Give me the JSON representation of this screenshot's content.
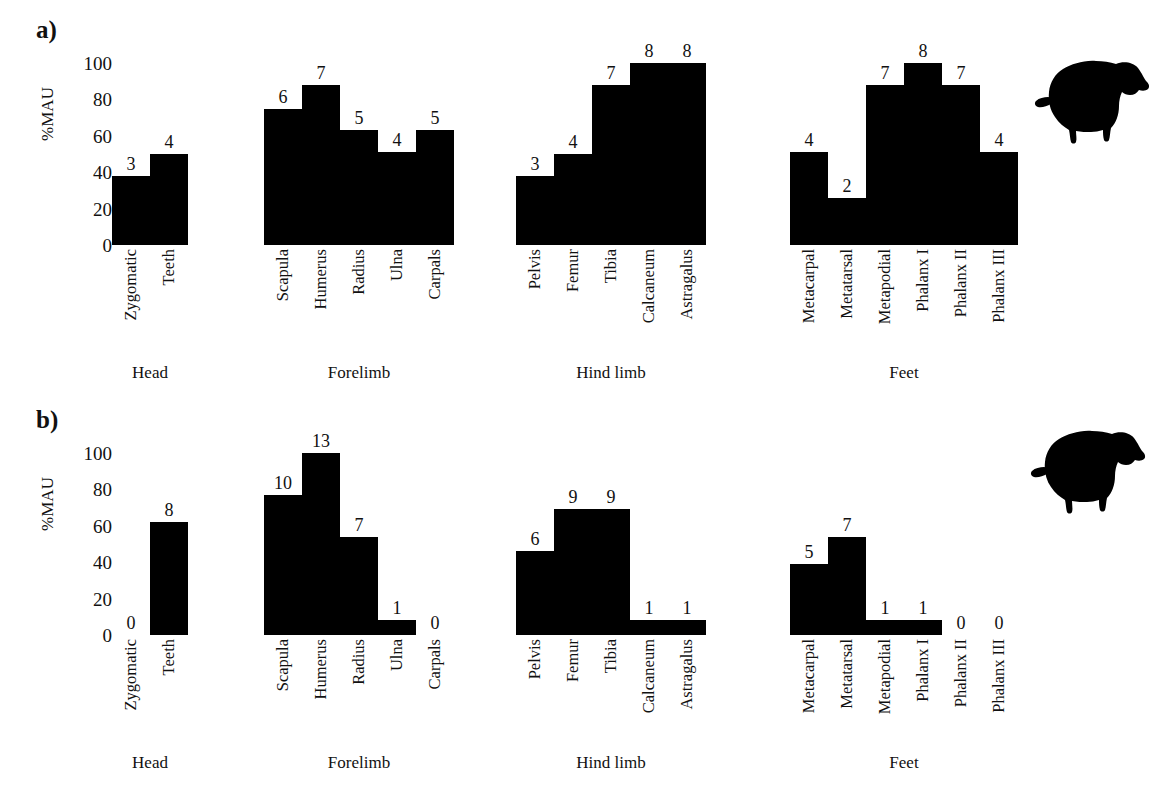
{
  "figure": {
    "panels": [
      {
        "id": "a",
        "label": "a)",
        "ylabel": "%MAU",
        "yticks": [
          "0",
          "20",
          "40",
          "60",
          "80",
          "100"
        ],
        "icon": "sheep-silhouette",
        "groups": [
          {
            "name": "Head",
            "categories": [
              "Zygomatic",
              "Teeth"
            ],
            "counts": [
              3,
              4
            ],
            "percent": [
              38,
              50
            ]
          },
          {
            "name": "Forelimb",
            "categories": [
              "Scapula",
              "Humerus",
              "Radius",
              "Ulna",
              "Carpals"
            ],
            "counts": [
              6,
              7,
              5,
              4,
              5
            ],
            "percent": [
              75,
              88,
              63,
              51,
              63
            ]
          },
          {
            "name": "Hind limb",
            "categories": [
              "Pelvis",
              "Femur",
              "Tibia",
              "Calcaneum",
              "Astragalus"
            ],
            "counts": [
              3,
              4,
              7,
              8,
              8
            ],
            "percent": [
              38,
              50,
              88,
              100,
              100
            ]
          },
          {
            "name": "Feet",
            "categories": [
              "Metacarpal",
              "Metatarsal",
              "Metapodial",
              "Phalanx I",
              "Phalanx II",
              "Phalanx III"
            ],
            "counts": [
              4,
              2,
              7,
              8,
              7,
              4
            ],
            "percent": [
              51,
              26,
              88,
              100,
              88,
              51
            ]
          }
        ]
      },
      {
        "id": "b",
        "label": "b)",
        "ylabel": "%MAU",
        "yticks": [
          "0",
          "20",
          "40",
          "60",
          "80",
          "100"
        ],
        "icon": "sheep-silhouette",
        "groups": [
          {
            "name": "Head",
            "categories": [
              "Zygomatic",
              "Teeth"
            ],
            "counts": [
              0,
              8
            ],
            "percent": [
              0,
              62
            ]
          },
          {
            "name": "Forelimb",
            "categories": [
              "Scapula",
              "Humerus",
              "Radius",
              "Ulna",
              "Carpals"
            ],
            "counts": [
              10,
              13,
              7,
              1,
              0
            ],
            "percent": [
              77,
              100,
              54,
              8,
              0
            ]
          },
          {
            "name": "Hind limb",
            "categories": [
              "Pelvis",
              "Femur",
              "Tibia",
              "Calcaneum",
              "Astragalus"
            ],
            "counts": [
              6,
              9,
              9,
              1,
              1
            ],
            "percent": [
              46,
              69,
              69,
              8,
              8
            ]
          },
          {
            "name": "Feet",
            "categories": [
              "Metacarpal",
              "Metatarsal",
              "Metapodial",
              "Phalanx I",
              "Phalanx II",
              "Phalanx III"
            ],
            "counts": [
              5,
              7,
              1,
              1,
              0,
              0
            ],
            "percent": [
              39,
              54,
              8,
              8,
              0,
              0
            ]
          }
        ]
      }
    ]
  },
  "chart_data": [
    {
      "type": "bar",
      "title": "a)",
      "xlabel": "",
      "ylabel": "%MAU",
      "ylim": [
        0,
        100
      ],
      "grid": false,
      "legend": "none",
      "group_labels": [
        "Head",
        "Forelimb",
        "Hind limb",
        "Feet"
      ],
      "categories": [
        "Zygomatic",
        "Teeth",
        "Scapula",
        "Humerus",
        "Radius",
        "Ulna",
        "Carpals",
        "Pelvis",
        "Femur",
        "Tibia",
        "Calcaneum",
        "Astragalus",
        "Metacarpal",
        "Metatarsal",
        "Metapodial",
        "Phalanx I",
        "Phalanx II",
        "Phalanx III"
      ],
      "values": [
        38,
        50,
        75,
        88,
        63,
        51,
        63,
        38,
        50,
        88,
        100,
        100,
        51,
        26,
        88,
        100,
        88,
        51
      ],
      "data_labels": [
        3,
        4,
        6,
        7,
        5,
        4,
        5,
        3,
        4,
        7,
        8,
        8,
        4,
        2,
        7,
        8,
        7,
        4
      ],
      "yticks": [
        0,
        20,
        40,
        60,
        80,
        100
      ]
    },
    {
      "type": "bar",
      "title": "b)",
      "xlabel": "",
      "ylabel": "%MAU",
      "ylim": [
        0,
        100
      ],
      "grid": false,
      "legend": "none",
      "group_labels": [
        "Head",
        "Forelimb",
        "Hind limb",
        "Feet"
      ],
      "categories": [
        "Zygomatic",
        "Teeth",
        "Scapula",
        "Humerus",
        "Radius",
        "Ulna",
        "Carpals",
        "Pelvis",
        "Femur",
        "Tibia",
        "Calcaneum",
        "Astragalus",
        "Metacarpal",
        "Metatarsal",
        "Metapodial",
        "Phalanx I",
        "Phalanx II",
        "Phalanx III"
      ],
      "values": [
        0,
        62,
        77,
        100,
        54,
        8,
        0,
        46,
        69,
        69,
        8,
        8,
        39,
        54,
        8,
        8,
        0,
        0
      ],
      "data_labels": [
        0,
        8,
        10,
        13,
        7,
        1,
        0,
        6,
        9,
        9,
        1,
        1,
        5,
        7,
        1,
        1,
        0,
        0
      ],
      "yticks": [
        0,
        20,
        40,
        60,
        80,
        100
      ]
    }
  ]
}
